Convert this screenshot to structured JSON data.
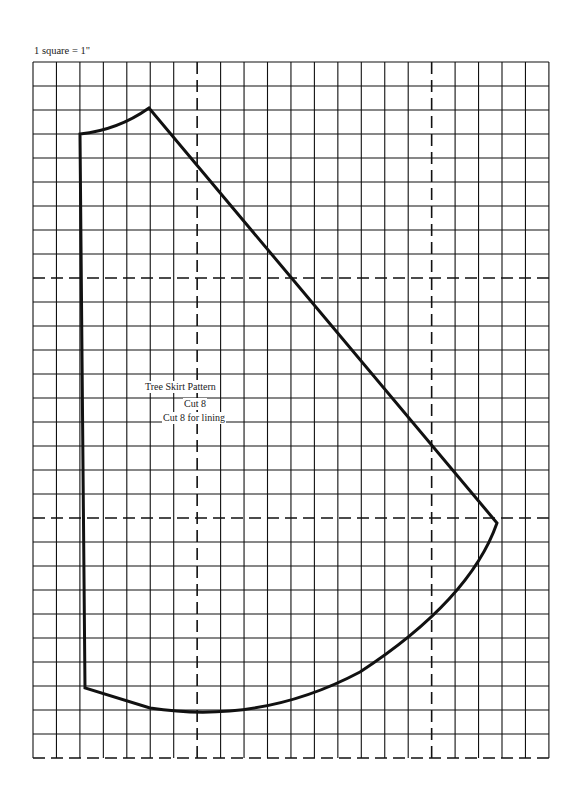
{
  "diagram": {
    "scale_label": "1 square = 1\"",
    "grid": {
      "columns": 22,
      "rows": 29,
      "dashed_columns": [
        7,
        17
      ],
      "dashed_rows": [
        9,
        19
      ],
      "bottom_border_dashed": true
    },
    "pattern": {
      "name": "Tree Skirt Pattern",
      "instructions": [
        "Cut 8",
        "Cut 8 for lining"
      ]
    },
    "colors": {
      "line": "#111111",
      "background": "#ffffff"
    }
  }
}
